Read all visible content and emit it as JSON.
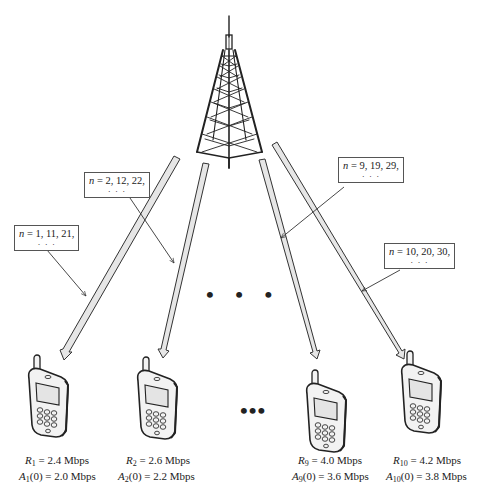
{
  "diagram": {
    "title": "",
    "tower": {
      "label": "base-station-tower"
    },
    "ellipsis_mid": "• • •",
    "ellipsis_bottom": "•••",
    "labels": [
      {
        "id": "box1",
        "n_text": "n",
        "rest": " = 1, 11, 21,",
        "dots": "· · ·"
      },
      {
        "id": "box2",
        "n_text": "n",
        "rest": " = 2, 12, 22,",
        "dots": "· · ·"
      },
      {
        "id": "box9",
        "n_text": "n",
        "rest": " = 9, 19, 29,",
        "dots": "· · ·"
      },
      {
        "id": "box10",
        "n_text": "n",
        "rest": " = 10, 20, 30,",
        "dots": "· · ·"
      }
    ],
    "users": [
      {
        "index": 1,
        "R_sym": "R",
        "R_sub": "1",
        "R_val": " = 2.4 Mbps",
        "A_sym": "A",
        "A_sub": "1",
        "A_val": "(0) = 2.0 Mbps"
      },
      {
        "index": 2,
        "R_sym": "R",
        "R_sub": "2",
        "R_val": " = 2.6 Mbps",
        "A_sym": "A",
        "A_sub": "2",
        "A_val": "(0) = 2.2 Mbps"
      },
      {
        "index": 9,
        "R_sym": "R",
        "R_sub": "9",
        "R_val": " = 4.0 Mbps",
        "A_sym": "A",
        "A_sub": "9",
        "A_val": "(0) = 3.6 Mbps"
      },
      {
        "index": 10,
        "R_sym": "R",
        "R_sub": "10",
        "R_val": " = 4.2 Mbps",
        "A_sym": "A",
        "A_sub": "10",
        "A_val": "(0) = 3.8 Mbps"
      }
    ],
    "colors": {
      "stroke": "#222222",
      "beam_fill": "#e6e6e6",
      "phone_fill": "#f2f2f2",
      "box_border": "#555555"
    }
  }
}
